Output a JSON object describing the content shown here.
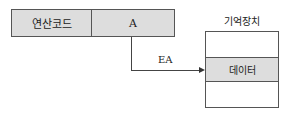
{
  "instruction": {
    "opcode_label": "연산코드",
    "address_label": "A"
  },
  "arrow": {
    "label": "EA"
  },
  "memory": {
    "title": "기억장치",
    "rows": [
      "",
      "데이터",
      ""
    ]
  },
  "colors": {
    "cell_fill": "#dddddd",
    "border": "#555555",
    "line": "#444444"
  }
}
